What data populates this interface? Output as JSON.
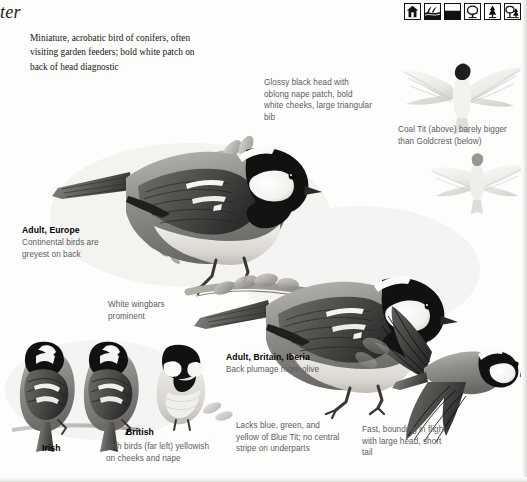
{
  "page": {
    "running_head": "ter",
    "background_color": "#fdfdfc",
    "ink_color": "#1a1a1a",
    "caption_color": "#5c5c5e"
  },
  "habitat_icons": [
    {
      "name": "house-garden-icon",
      "label": "gardens"
    },
    {
      "name": "reeds-wetland-icon",
      "label": "wetland"
    },
    {
      "name": "open-ground-icon",
      "label": "open ground"
    },
    {
      "name": "broadleaf-tree-icon",
      "label": "broadleaved woodland"
    },
    {
      "name": "conifer-tree-icon",
      "label": "coniferous woodland"
    },
    {
      "name": "mixed-woodland-icon",
      "label": "mixed woodland"
    }
  ],
  "intro": {
    "text": "Miniature, acrobatic bird of conifers, often visiting garden feeders; bold white patch on back of head diagnostic"
  },
  "annotations": [
    {
      "id": "head-pattern",
      "text": "Glossy black head with oblong nape patch, bold white cheeks, large triangular bib"
    },
    {
      "id": "size-comparison",
      "text": "Coal Tit (above) barely bigger than Goldcrest (below)"
    },
    {
      "id": "wingbars",
      "text": "White wingbars prominent"
    },
    {
      "id": "irish-birds",
      "text": "Irish birds (far left) yellowish on cheeks and nape"
    },
    {
      "id": "underparts",
      "text": "Lacks blue, green, and yellow of Blue Tit; no central stripe on underparts"
    },
    {
      "id": "flight-action",
      "text": "Fast, bounding in flight, with large head, short tail"
    }
  ],
  "plate_labels": [
    {
      "id": "adult-europe",
      "heading": "Adult, Europe",
      "detail": "Continental birds are greyest on back"
    },
    {
      "id": "adult-britain-iberia",
      "heading": "Adult, Britain, Iberia",
      "detail": "Back plumage more olive"
    }
  ],
  "race_labels": [
    {
      "id": "irish",
      "text": "Irish"
    },
    {
      "id": "british",
      "text": "British"
    }
  ]
}
